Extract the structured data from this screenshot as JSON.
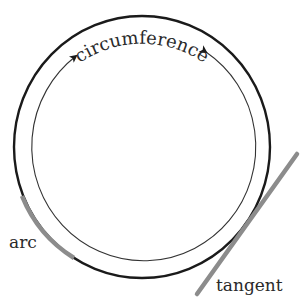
{
  "diagram": {
    "labels": {
      "circumference": "circumference",
      "arc": "arc",
      "tangent": "tangent"
    },
    "colors": {
      "circle_stroke": "#1a1a1a",
      "inner_stroke": "#333333",
      "highlight": "#8c8c8c",
      "text": "#2a2a2a",
      "background": "#ffffff"
    },
    "elements": [
      {
        "name": "outer-circle",
        "type": "circle"
      },
      {
        "name": "circumference-arrows",
        "type": "double-arrow-arc"
      },
      {
        "name": "arc-segment",
        "type": "highlighted-arc"
      },
      {
        "name": "tangent-line",
        "type": "line"
      }
    ]
  }
}
